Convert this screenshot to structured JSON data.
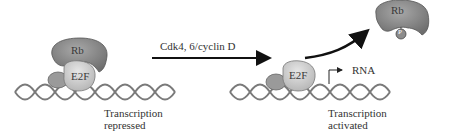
{
  "diagram": {
    "left_state": {
      "proteins": [
        "Rb",
        "E2F"
      ],
      "caption_line1": "Transcription",
      "caption_line2": "repressed"
    },
    "transition": {
      "label": "Cdk4, 6/cyclin D"
    },
    "right_state": {
      "bound_protein": "E2F",
      "released_protein": "Rb",
      "phosphate_label": "P",
      "product_label": "RNA",
      "caption_line1": "Transcription",
      "caption_line2": "activated"
    },
    "colors": {
      "rb_fill": "#8a8a8a",
      "e2f_fill": "#cfcfcf",
      "dna_stroke": "#7a7a7a",
      "arrow": "#111111"
    }
  }
}
